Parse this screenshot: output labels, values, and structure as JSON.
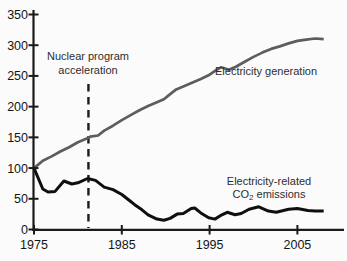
{
  "chart_data": {
    "type": "line",
    "title": "",
    "xlabel": "",
    "ylabel": "",
    "x_axis": {
      "min": 1975,
      "max": 2008,
      "ticks": [
        1975,
        1985,
        1995,
        2005
      ]
    },
    "y_axis": {
      "min": 0,
      "max": 350,
      "ticks": [
        0,
        50,
        100,
        150,
        200,
        250,
        300,
        350
      ]
    },
    "grid": "off",
    "legend": "inline-labels",
    "series": [
      {
        "name": "Electricity generation",
        "color": "#5d5d5d",
        "points": [
          [
            1975,
            100
          ],
          [
            1976,
            112
          ],
          [
            1977,
            119
          ],
          [
            1978,
            127
          ],
          [
            1979,
            134
          ],
          [
            1980,
            142
          ],
          [
            1981,
            148
          ],
          [
            1981.4,
            151
          ],
          [
            1982.3,
            153
          ],
          [
            1983,
            161
          ],
          [
            1984,
            169
          ],
          [
            1985,
            178
          ],
          [
            1986,
            186
          ],
          [
            1987,
            194
          ],
          [
            1988,
            201
          ],
          [
            1989,
            207
          ],
          [
            1989.8,
            212
          ],
          [
            1990.3,
            218
          ],
          [
            1991.2,
            228
          ],
          [
            1992,
            233
          ],
          [
            1993,
            239
          ],
          [
            1994,
            245
          ],
          [
            1995,
            252
          ],
          [
            1995.8,
            260
          ],
          [
            1996.3,
            264
          ],
          [
            1997.2,
            260
          ],
          [
            1998,
            265
          ],
          [
            1999,
            273
          ],
          [
            2000,
            281
          ],
          [
            2001,
            288
          ],
          [
            2002,
            294
          ],
          [
            2003,
            298
          ],
          [
            2004,
            303
          ],
          [
            2005,
            307
          ],
          [
            2006,
            309
          ],
          [
            2007,
            311
          ],
          [
            2008,
            310
          ]
        ]
      },
      {
        "name": "Electricity-related CO2 emissions",
        "color": "#0f0f0f",
        "points": [
          [
            1975,
            100
          ],
          [
            1976,
            66
          ],
          [
            1976.6,
            61
          ],
          [
            1977.4,
            62
          ],
          [
            1978.4,
            79
          ],
          [
            1979.3,
            74
          ],
          [
            1980,
            76
          ],
          [
            1981.1,
            83
          ],
          [
            1982,
            80
          ],
          [
            1983,
            69
          ],
          [
            1984,
            65
          ],
          [
            1985,
            57
          ],
          [
            1985.8,
            48
          ],
          [
            1986.5,
            40
          ],
          [
            1987.3,
            32
          ],
          [
            1988,
            24
          ],
          [
            1989,
            17
          ],
          [
            1989.8,
            15
          ],
          [
            1990.5,
            18
          ],
          [
            1991.3,
            25
          ],
          [
            1992,
            26
          ],
          [
            1992.9,
            34
          ],
          [
            1993.3,
            35
          ],
          [
            1994,
            27
          ],
          [
            1994.9,
            19
          ],
          [
            1995.6,
            17
          ],
          [
            1996.4,
            24
          ],
          [
            1997,
            28
          ],
          [
            1997.9,
            24
          ],
          [
            1998.6,
            26
          ],
          [
            1999.5,
            33
          ],
          [
            2000.6,
            37
          ],
          [
            2001.7,
            30
          ],
          [
            2002.6,
            28
          ],
          [
            2004,
            33
          ],
          [
            2005,
            34
          ],
          [
            2006.2,
            31
          ],
          [
            2007,
            30
          ],
          [
            2008,
            30
          ]
        ]
      }
    ],
    "annotations": {
      "dashed_line": {
        "year": 1981.2,
        "label_line1": "Nuclear program",
        "label_line2": "acceleration"
      },
      "generation_label": "Electricity generation",
      "emissions_label_line1": "Electricity-related",
      "emissions_label_co": "CO",
      "emissions_label_sub": "2",
      "emissions_label_suffix": " emissions"
    }
  }
}
